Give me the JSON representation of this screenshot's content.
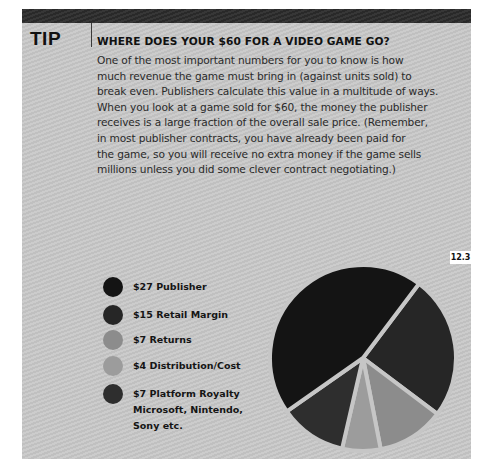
{
  "tip": {
    "label": "TIP",
    "heading": "WHERE DOES YOUR $60 FOR A VIDEO GAME GO?",
    "body_lines": [
      "One of the most important numbers for you to know is how",
      "much revenue the game must bring in (against units sold) to",
      "break even. Publishers calculate this value in a multitude of ways.",
      "When you look at a game sold for $60, the money the publisher",
      "receives is a large fraction of the overall sale price. (Remember,",
      "in most publisher contracts, you have already been paid for",
      "the game, so you will receive no extra money if the game sells",
      "millions unless you did some clever contract negotiating.)"
    ]
  },
  "figure": {
    "number": "12.3"
  },
  "legend": [
    {
      "label": "$27 Publisher",
      "sub": "",
      "color": "#141414"
    },
    {
      "label": "$15 Retail Margin",
      "sub": "",
      "color": "#262626"
    },
    {
      "label": "$7 Returns",
      "sub": "",
      "color": "#8c8c8c"
    },
    {
      "label": "$4 Distribution/Cost",
      "sub": "",
      "color": "#9c9c9c"
    },
    {
      "label": "$7 Platform Royalty",
      "sub": "Microsoft, Nintendo,",
      "sub2": "Sony etc.",
      "color": "#2e2e2e"
    }
  ],
  "chart_data": {
    "type": "pie",
    "title": "WHERE DOES YOUR $60 FOR A VIDEO GAME GO?",
    "total": 60,
    "categories": [
      "Publisher",
      "Retail Margin",
      "Returns",
      "Distribution/Cost",
      "Platform Royalty (Microsoft, Nintendo, Sony etc.)"
    ],
    "values": [
      27,
      15,
      7,
      4,
      7
    ],
    "colors": [
      "#141414",
      "#262626",
      "#8c8c8c",
      "#9c9c9c",
      "#2e2e2e"
    ],
    "legend_position": "left",
    "slice_order_clockwise_from_37deg": [
      "Retail Margin",
      "Returns",
      "Distribution/Cost",
      "Platform Royalty",
      "Publisher"
    ],
    "exploded_gaps": true
  }
}
